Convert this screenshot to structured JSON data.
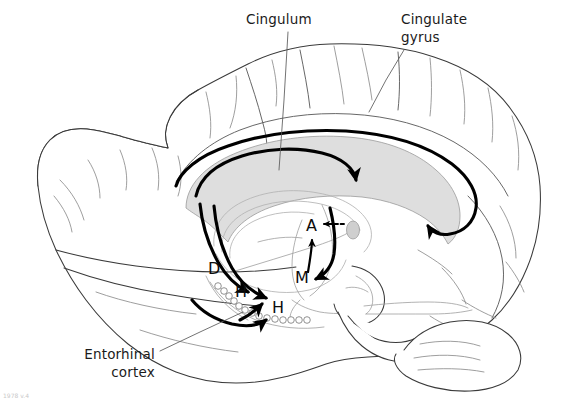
{
  "figure": {
    "background_color": "#ffffff",
    "line_color": "#3a3a3a",
    "tract_color": "#000000",
    "callosum_fill": "#dedede",
    "width": 566,
    "height": 402
  },
  "labels": [
    {
      "id": "cingulum",
      "lines": [
        "Cingulum"
      ],
      "x": 246,
      "y": 24,
      "anchor": "start",
      "leader": "M288,30 L283,120 L278,172"
    },
    {
      "id": "cingulate-gyrus",
      "lines": [
        "Cingulate",
        "gyrus"
      ],
      "x": 401,
      "y": 24,
      "anchor": "start",
      "leader": "M404,48 L382,83 L368,112"
    },
    {
      "id": "entorhinal-cortex",
      "lines": [
        "Entorhinal",
        "cortex"
      ],
      "x": 155,
      "y": 359,
      "anchor": "end",
      "leader": "M161,352 L240,314"
    }
  ],
  "structure_markers": [
    {
      "id": "marker-d",
      "letter": "D",
      "meaning": "dentate gyrus",
      "x": 208,
      "y": 274
    },
    {
      "id": "marker-h-upper",
      "letter": "H",
      "meaning": "hippocampus",
      "x": 239,
      "y": 296
    },
    {
      "id": "marker-h-lower",
      "letter": "H",
      "meaning": "hippocampus",
      "x": 276,
      "y": 312
    },
    {
      "id": "marker-m",
      "letter": "M",
      "meaning": "mammillary body",
      "x": 298,
      "y": 282
    },
    {
      "id": "marker-a",
      "letter": "A",
      "meaning": "anterior thalamic nucleus",
      "x": 313,
      "y": 229
    }
  ],
  "tracts": [
    {
      "id": "cingulum-bundle",
      "name": "cingulum bundle",
      "style": "solid-thick",
      "arrow": "terminal-up"
    },
    {
      "id": "fornix",
      "name": "fornix",
      "style": "solid-thick",
      "arrow": "terminal-down"
    },
    {
      "id": "mammillothalamic",
      "name": "mammillothalamic tract",
      "style": "solid-thin",
      "arrow": "terminal-up"
    },
    {
      "id": "thalamocingulate",
      "name": "anterior thalamus to cingulate projection",
      "style": "dashed",
      "arrow": "terminal-left"
    },
    {
      "id": "entorhinal-hippocampal",
      "name": "entorhinal to hippocampal projection",
      "style": "solid-thick",
      "arrow": "terminal-down-right"
    }
  ],
  "credit": {
    "text": "1978 v.4"
  }
}
